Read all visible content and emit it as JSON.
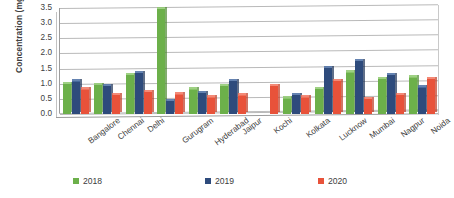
{
  "chart_data": {
    "type": "bar",
    "title": "",
    "xlabel": "",
    "ylabel": "Concentration (mg/m³)",
    "ylim": [
      0,
      3.5
    ],
    "ytick_labels": [
      "3.5",
      "3.0",
      "2.5",
      "2.0",
      "1.5",
      "1.0",
      "0.5",
      "0.0"
    ],
    "ytick_values": [
      3.5,
      3.0,
      2.5,
      2.0,
      1.5,
      1.0,
      0.5,
      0.0
    ],
    "grid": true,
    "legend_position": "bottom",
    "categories": [
      "Bangalore",
      "Chennai",
      "Delhi",
      "Gurugram",
      "Hyderabad",
      "Jaipur",
      "Kochi",
      "Kolkata",
      "Lucknow",
      "Mumbai",
      "Nagpur",
      "Noida"
    ],
    "series": [
      {
        "name": "2018",
        "color": "#6cb04a",
        "values": [
          1.0,
          0.97,
          1.3,
          3.47,
          0.82,
          0.93,
          null,
          0.52,
          0.84,
          1.38,
          1.16,
          1.22
        ]
      },
      {
        "name": "2019",
        "color": "#2e4b7c",
        "values": [
          1.09,
          0.93,
          1.37,
          0.44,
          0.71,
          1.1,
          null,
          0.63,
          1.52,
          1.76,
          1.3,
          0.89
        ]
      },
      {
        "name": "2020",
        "color": "#e8523a",
        "values": [
          0.81,
          0.63,
          0.74,
          0.66,
          0.55,
          0.62,
          0.94,
          0.55,
          1.1,
          0.51,
          0.64,
          1.17
        ]
      }
    ]
  },
  "legend": {
    "items": [
      {
        "label": "2018"
      },
      {
        "label": "2019"
      },
      {
        "label": "2020"
      }
    ]
  }
}
